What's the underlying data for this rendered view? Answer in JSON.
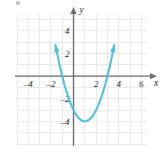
{
  "figure": {
    "name": "parabola-graph",
    "alt": "Graph of an upward opening parabola on a coordinate grid",
    "background_color": "#ffffff",
    "grid_color": "#e3e3e8",
    "axis_color": "#6e6e72",
    "curve_color": "#4fc3dd",
    "label_color": "#231f20"
  },
  "axes": {
    "x_axis_label": "x",
    "y_axis_label": "y",
    "x_tick_labels": [
      "–4",
      "–2",
      "2",
      "4",
      "6"
    ],
    "x_tick_values": [
      -4,
      -2,
      2,
      4,
      6
    ],
    "y_tick_labels": [
      "4",
      "2",
      "–2",
      "–4"
    ],
    "y_tick_values": [
      4,
      2,
      -2,
      -4
    ],
    "x_arrow": true,
    "y_arrow": true
  },
  "chart_data": {
    "type": "line",
    "title": "",
    "subtitle": "",
    "xlabel": "x",
    "ylabel": "y",
    "xlim": [
      -5,
      6.5
    ],
    "ylim": [
      -6,
      5.5
    ],
    "grid": true,
    "grid_step": 1,
    "legend": "none",
    "annotations": [],
    "series": [
      {
        "name": "parabola",
        "color": "#4fc3dd",
        "equation": "y = (x - 1)^2 - 4",
        "vertex": [
          1,
          -4
        ],
        "roots": [
          -1,
          3
        ],
        "y_intercept": -3,
        "opens": "up",
        "arrow_start": true,
        "arrow_end": true,
        "x": [
          -1.6,
          -1.4,
          -1.2,
          -1.0,
          -0.8,
          -0.6,
          -0.4,
          -0.2,
          0.0,
          0.2,
          0.4,
          0.6,
          0.8,
          1.0,
          1.2,
          1.4,
          1.6,
          1.8,
          2.0,
          2.2,
          2.4,
          2.6,
          2.8,
          3.0,
          3.2,
          3.4,
          3.6
        ],
        "y": [
          2.76,
          1.76,
          0.84,
          0.0,
          -0.76,
          -1.44,
          -2.04,
          -2.56,
          -3.0,
          -3.36,
          -3.64,
          -3.84,
          -3.96,
          -4.0,
          -3.96,
          -3.84,
          -3.64,
          -3.36,
          -3.0,
          -2.56,
          -2.04,
          -1.44,
          -0.76,
          0.0,
          0.84,
          1.76,
          2.76
        ]
      }
    ]
  }
}
